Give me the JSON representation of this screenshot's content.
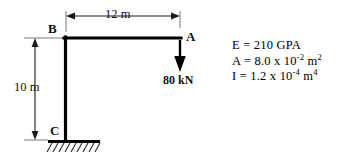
{
  "figure": {
    "type": "structural-frame-diagram",
    "background_color": "#ffffff",
    "line_color": "#000000"
  },
  "joints": {
    "top_right": "A",
    "top_left": "B",
    "base": "C"
  },
  "dimensions": {
    "span": "12 m",
    "height": "10 m"
  },
  "load": {
    "magnitude": "80 kN",
    "direction": "down"
  },
  "properties": {
    "modulus": {
      "symbol": "E",
      "equals": "=",
      "value": "210",
      "unit": "GPA",
      "text": "E = 210 GPA"
    },
    "area": {
      "symbol": "A",
      "equals": "=",
      "mantissa": "8.0",
      "times": "x",
      "base": "10",
      "exponent": "-2",
      "unit": "m",
      "unit_exponent": "2",
      "text": "A = 8.0 x 10-2 m2"
    },
    "inertia": {
      "symbol": "I",
      "equals": "=",
      "mantissa": "1.2",
      "times": "x",
      "base": "10",
      "exponent": "-4",
      "unit": "m",
      "unit_exponent": "4",
      "text": "I = 1.2 x 10-4 m4"
    }
  },
  "support": {
    "type": "fixed",
    "location": "C"
  }
}
